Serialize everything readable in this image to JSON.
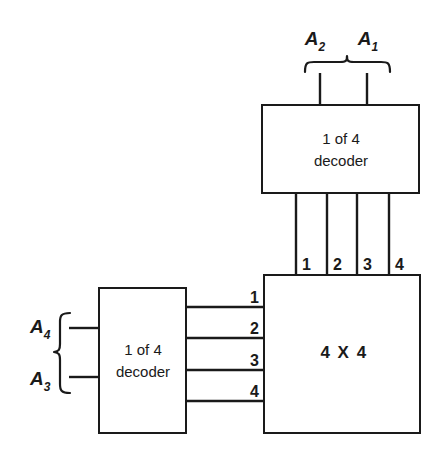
{
  "diagram": {
    "type": "block-diagram",
    "background_color": "#ffffff",
    "line_color": "#1a1a1a",
    "blocks": {
      "top_decoder": {
        "label_line1": "1 of 4",
        "label_line2": "decoder",
        "x": 262,
        "y": 105,
        "width": 157,
        "height": 88
      },
      "left_decoder": {
        "label_line1": "1 of 4",
        "label_line2": "decoder",
        "x": 99,
        "y": 288,
        "width": 87,
        "height": 145
      },
      "matrix": {
        "label": "4 X 4",
        "x": 264,
        "y": 275,
        "width": 156,
        "height": 158
      }
    },
    "address_inputs": {
      "top": {
        "labels": [
          {
            "base": "A",
            "sub": "2",
            "x": 315,
            "y": 45
          },
          {
            "base": "A",
            "sub": "1",
            "x": 368,
            "y": 45
          }
        ],
        "brace_orientation": "down"
      },
      "left": {
        "labels": [
          {
            "base": "A",
            "sub": "4",
            "x": 37,
            "y": 333
          },
          {
            "base": "A",
            "sub": "3",
            "x": 37,
            "y": 385
          }
        ],
        "brace_orientation": "right"
      }
    },
    "column_select_lines": {
      "labels": [
        "1",
        "2",
        "3",
        "4"
      ],
      "x_positions": [
        296,
        327,
        357,
        389
      ],
      "label_y": 269
    },
    "row_select_lines": {
      "labels": [
        "1",
        "2",
        "3",
        "4"
      ],
      "y_positions": [
        307,
        338,
        370,
        401
      ],
      "label_x": 258
    }
  }
}
